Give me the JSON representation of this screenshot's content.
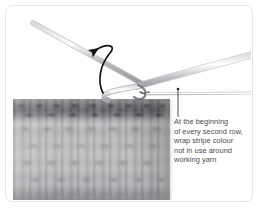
{
  "figure": {
    "border_color": "#e6e6e6",
    "background_color": "#ffffff"
  },
  "caption": {
    "full_text": "At the beginning of every second row, wrap stripe colour not in use around working yarn",
    "lines": [
      "At the beginning",
      "of every second row,",
      "wrap stripe colour",
      "not in use around",
      "working yarn"
    ],
    "text_color": "#4a4a4c"
  },
  "photo": {
    "subject": "crochet swatch with crochet hook and yarn",
    "swatch": {
      "label": "crochet fabric swatch",
      "stripe_rows": [
        {
          "name": "dark-stripe-row",
          "color": "#5e5f63"
        },
        {
          "name": "light-stripe-row",
          "color": "#b7b8ba"
        },
        {
          "name": "light-stripe-row",
          "color": "#b2b3b5"
        },
        {
          "name": "light-stripe-row",
          "color": "#adaeb0"
        },
        {
          "name": "light-stripe-row",
          "color": "#a0a1a4"
        }
      ]
    },
    "hook": {
      "label": "crochet hook",
      "color": "#c9cacc"
    },
    "yarn_strands": [
      {
        "name": "working-yarn-strand",
        "color": "#b6b7ba"
      },
      {
        "name": "stripe-colour-yarn-strand",
        "color": "#cfd0d2"
      }
    ],
    "arrow": {
      "label": "wrap-direction-arrow",
      "color": "#1c1c1c",
      "direction": "counter-clockwise wrap, pointing left"
    },
    "leader_line": {
      "label": "caption-leader-line",
      "color": "#3a3a3c"
    }
  }
}
